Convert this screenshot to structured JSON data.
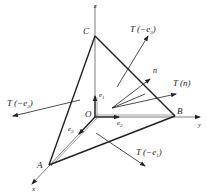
{
  "diagram": {
    "type": "tetrahedron-stress-vectors",
    "axes": {
      "x": "x",
      "y": "y",
      "z": "z"
    },
    "points": {
      "origin": "O",
      "A": "A",
      "B": "B",
      "C": "C"
    },
    "unit_vectors": {
      "e1": "e",
      "e1_sub": "1",
      "e2": "e",
      "e2_sub": "2",
      "e3": "e",
      "e3_sub": "3"
    },
    "normal": "n",
    "traction_labels": {
      "T_neg_e3": {
        "main": "T (−e",
        "sub": "3",
        "close": ")"
      },
      "T_n": "T (n)",
      "T_neg_e1": {
        "main": "T (−e",
        "sub": "1",
        "close": ")"
      },
      "T_neg_e2": {
        "main": "T (−e",
        "sub": "2",
        "close": ")"
      }
    },
    "colors": {
      "line": "#222222",
      "axis": "#555555"
    }
  }
}
